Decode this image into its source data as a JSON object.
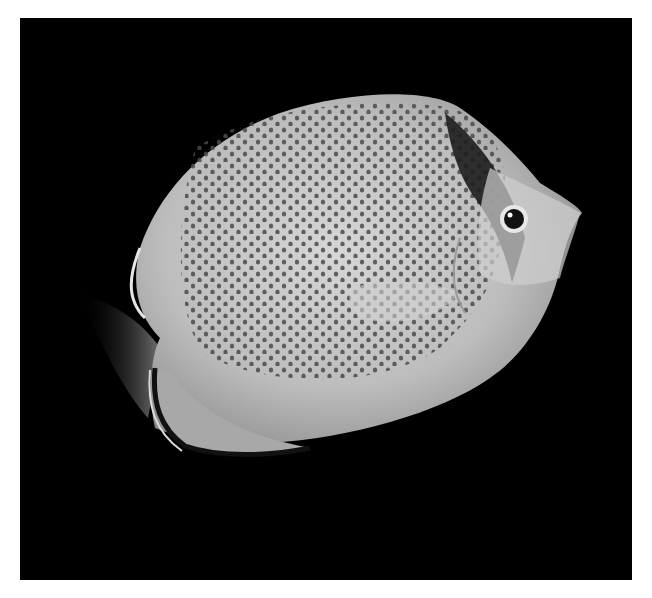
{
  "image": {
    "subject": "butterflyfish",
    "description": "Black-and-white photograph of a spotted butterflyfish on a black background, facing right",
    "background_color": "#000000",
    "border_color": "#ffffff",
    "body_color": "#c9c9c9",
    "spot_color": "#4a4a4a",
    "eye_band_color": "#1e1e1e"
  }
}
